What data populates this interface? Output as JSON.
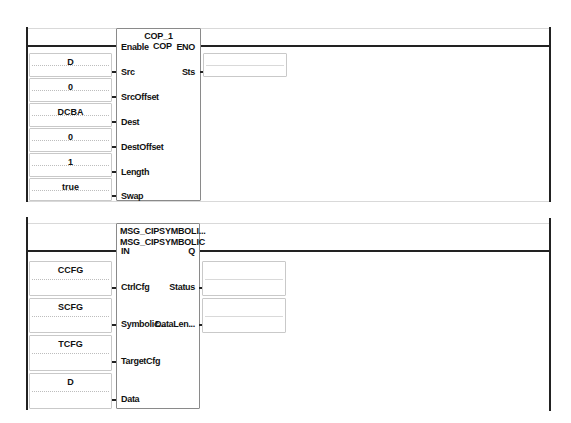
{
  "rung1": {
    "instruction": {
      "tag": "COP_1",
      "type": "COP",
      "enable_pin": "Enable",
      "eno_pin": "ENO",
      "inputs": [
        {
          "pin": "Src",
          "value": "D"
        },
        {
          "pin": "SrcOffset",
          "value": "0"
        },
        {
          "pin": "Dest",
          "value": "DCBA"
        },
        {
          "pin": "DestOffset",
          "value": "0"
        },
        {
          "pin": "Length",
          "value": "1"
        },
        {
          "pin": "Swap",
          "value": "true"
        }
      ],
      "outputs": [
        {
          "pin": "Sts",
          "value": ""
        }
      ]
    }
  },
  "rung2": {
    "instruction": {
      "tag": "MSG_CIPSYMBOLI...",
      "type": "MSG_CIPSYMBOLIC",
      "enable_pin": "IN",
      "eno_pin": "Q",
      "inputs": [
        {
          "pin": "CtrlCfg",
          "value": "CCFG"
        },
        {
          "pin": "Symbolic...",
          "value": "SCFG"
        },
        {
          "pin": "TargetCfg",
          "value": "TCFG"
        },
        {
          "pin": "Data",
          "value": "D"
        }
      ],
      "outputs": [
        {
          "pin": "Status",
          "value": ""
        },
        {
          "pin": "DataLen...",
          "value": ""
        }
      ]
    }
  }
}
